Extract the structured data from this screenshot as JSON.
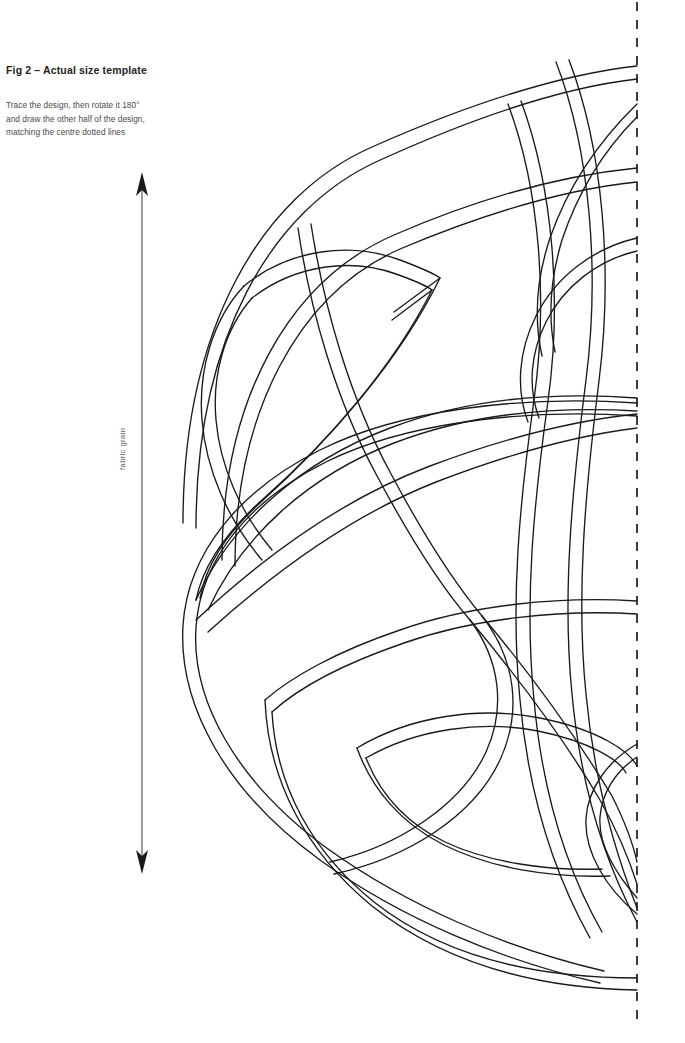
{
  "page": {
    "width": 685,
    "height": 1043,
    "background_color": "#ffffff",
    "ink_color": "#1a1a1a"
  },
  "figure": {
    "title": "Fig 2 – Actual size template",
    "instructions": [
      "Trace the design, then rotate it 180°",
      "and draw the other half of the design,",
      "matching the centre dotted lines"
    ],
    "grain_label": "fabric grain"
  },
  "diagram": {
    "type": "celtic-knotwork-half-template",
    "centre_line": {
      "name": "centre dotted line",
      "orientation": "vertical",
      "x": 637,
      "y_start": 2,
      "y_end": 1026,
      "style": "dashed"
    },
    "grain_arrow": {
      "name": "fabric grain double arrow",
      "orientation": "vertical",
      "x": 142,
      "y_top": 175,
      "y_bottom": 870,
      "heads": "both"
    },
    "band_style": {
      "rendering": "outline ribbon (two parallel strokes)",
      "ribbon_width": 13,
      "stroke_width": 1.35
    }
  }
}
